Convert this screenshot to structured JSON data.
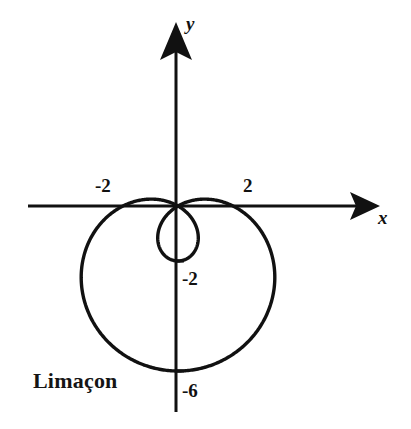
{
  "figure": {
    "caption": "Limaçon",
    "background_color": "#ffffff",
    "ink_color": "#111111"
  },
  "axes": {
    "x_label": "x",
    "y_label": "y",
    "origin_px": [
      178,
      206
    ],
    "unit_px": 27.5,
    "x_axis_px": [
      28,
      380
    ],
    "y_axis_px": [
      22,
      412
    ],
    "arrowheads": [
      "x-positive",
      "y-positive"
    ]
  },
  "ticks": [
    {
      "name": "x-neg-2",
      "label": "-2",
      "value": -2,
      "axis": "x"
    },
    {
      "name": "x-pos-2",
      "label": "2",
      "value": 2,
      "axis": "x"
    },
    {
      "name": "y-neg-2",
      "label": "-2",
      "value": -2,
      "axis": "y"
    },
    {
      "name": "y-neg-6",
      "label": "-6",
      "value": -6,
      "axis": "y"
    }
  ],
  "chart_data": {
    "type": "line",
    "plot_kind": "polar-curve",
    "title": "Limaçon",
    "xlabel": "x",
    "ylabel": "y",
    "equation": "r = 2 - 4 sin(theta)",
    "a": 2,
    "b": 4,
    "grid": false,
    "legend": false,
    "xlim": [
      -6.4,
      7.4
    ],
    "ylim": [
      -8.1,
      6.7
    ],
    "x_tick_labels": [
      "-2",
      "2"
    ],
    "x_tick_values": [
      -2,
      2
    ],
    "y_tick_labels": [
      "-2",
      "-6"
    ],
    "y_tick_values": [
      -2,
      -6
    ],
    "annotations": [
      "Limaçon"
    ],
    "features": {
      "x_intercepts": [
        -2,
        2
      ],
      "outer_loop_bottom_y": -6,
      "inner_loop_bottom_y": -2,
      "outer_loop_left_x": -3.0,
      "outer_loop_right_x": 3.0,
      "hump_peak_y": 0.45,
      "node_at_origin": true
    },
    "points_note": "Curve sampled from r = 2 - 4 sin(theta), theta in [0, 2*pi)"
  }
}
